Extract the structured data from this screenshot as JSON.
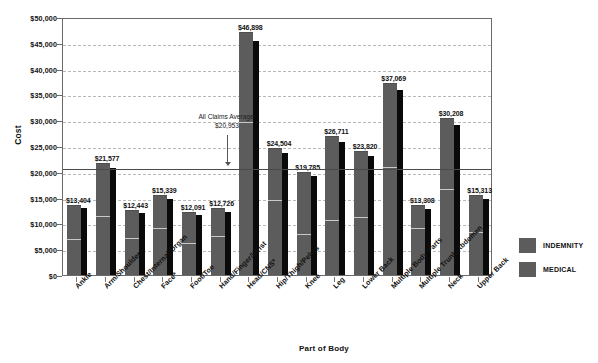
{
  "chart_data": {
    "type": "bar",
    "title": "",
    "xlabel": "Part of Body",
    "ylabel": "Cost",
    "ylim": [
      0,
      50000
    ],
    "ytick_step": 5000,
    "grid": true,
    "legend_position": "right",
    "categories": [
      "Ankle",
      "Arm/Shoulder",
      "Chest/Internal Organ",
      "Face*",
      "Foot/Toe",
      "Hand/Finger/Wrist",
      "Head/CNS*",
      "Hip/Thigh/Pelvis",
      "Knee",
      "Leg",
      "Lower Back",
      "Multiple Body Parts",
      "Multiple Trunk/Abdomen",
      "Neck",
      "Upper Back"
    ],
    "total_labels": [
      "$13,404",
      "$21,577",
      "$12,443",
      "$15,339",
      "$12,091",
      "$12,726",
      "$46,898",
      "$24,504",
      "$19,785",
      "$26,711",
      "$23,820",
      "$37,069",
      "$13,308",
      "$30,208",
      "$15,313"
    ],
    "totals": [
      13404,
      21577,
      12443,
      15339,
      12091,
      12726,
      46898,
      24504,
      19785,
      26711,
      23820,
      37069,
      13308,
      30208,
      15313
    ],
    "series": [
      {
        "name": "INDEMNITY",
        "values": [
          6700,
          11200,
          7000,
          9000,
          6100,
          7300,
          29500,
          14300,
          7700,
          10500,
          11100,
          20700,
          8900,
          16500,
          8200
        ]
      },
      {
        "name": "MEDICAL",
        "values": [
          6704,
          10377,
          5443,
          6339,
          5991,
          5426,
          17398,
          10204,
          12085,
          16211,
          12720,
          16369,
          4408,
          13708,
          7113
        ]
      }
    ],
    "annotation": {
      "line1": "All Claims Average:",
      "line2": "$20,953",
      "value": 20953
    },
    "ytick_labels": [
      "$0",
      "$5,000",
      "$10,000",
      "$15,000",
      "$20,000",
      "$25,000",
      "$30,000",
      "$35,000",
      "$40,000",
      "$45,000",
      "$50,000"
    ],
    "legend": [
      "INDEMNITY",
      "MEDICAL"
    ],
    "colors": {
      "bar_front": "#5c5c5c",
      "bar_shadow": "#0a0a0a",
      "bar_split": "#c8c8c8",
      "gridline": "#b8b8b8",
      "axis": "#6a6a6a",
      "average_line": "#4a4a4a",
      "text": "#111111"
    }
  }
}
